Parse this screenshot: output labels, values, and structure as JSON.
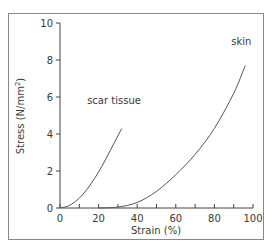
{
  "chart_data": {
    "type": "line",
    "title": "",
    "xlabel": "Strain (%)",
    "ylabel": "Stress (N/mm²)",
    "ylabel_parts": {
      "main": "Stress (N/mm",
      "sup": "2",
      "end": ")"
    },
    "xlim": [
      0,
      100
    ],
    "ylim": [
      0,
      10
    ],
    "xticks": [
      0,
      20,
      40,
      60,
      80,
      100
    ],
    "xtick_labels": [
      "0",
      "20",
      "40",
      "60",
      "80",
      "100"
    ],
    "xminor_ticks": [
      10,
      30,
      50,
      70,
      90
    ],
    "yticks": [
      0,
      2,
      4,
      6,
      8,
      10
    ],
    "ytick_labels": [
      "0",
      "2",
      "4",
      "6",
      "8",
      "10"
    ],
    "grid": false,
    "legend": "none (inline series labels)",
    "series": [
      {
        "name": "scar tissue",
        "x": [
          0,
          4,
          8,
          12,
          16,
          20,
          24,
          28,
          32
        ],
        "y": [
          0,
          0.1,
          0.35,
          0.75,
          1.3,
          1.95,
          2.7,
          3.5,
          4.3
        ],
        "label_pos": [
          28,
          5.6
        ]
      },
      {
        "name": "skin",
        "x": [
          20,
          30,
          40,
          50,
          60,
          70,
          80,
          90,
          96
        ],
        "y": [
          0,
          0.05,
          0.3,
          0.9,
          1.8,
          2.9,
          4.3,
          6.2,
          7.7
        ],
        "label_pos": [
          94,
          8.8
        ]
      }
    ],
    "colors": {
      "line": "#555555",
      "axis": "#444444",
      "frame": "#888888",
      "text": "#3a3a3a"
    }
  }
}
